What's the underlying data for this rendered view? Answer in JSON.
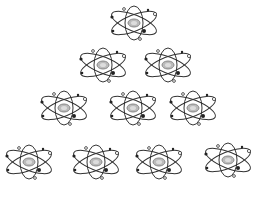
{
  "figure": {
    "rows": [
      {
        "count": 1,
        "atoms": [
          {
            "x": 107,
            "y": 4
          }
        ]
      },
      {
        "count": 2,
        "atoms": [
          {
            "x": 76,
            "y": 46
          },
          {
            "x": 141,
            "y": 46
          }
        ]
      },
      {
        "count": 3,
        "atoms": [
          {
            "x": 37,
            "y": 89
          },
          {
            "x": 106,
            "y": 89
          },
          {
            "x": 166,
            "y": 89
          }
        ]
      },
      {
        "count": 4,
        "atoms": [
          {
            "x": 2,
            "y": 143
          },
          {
            "x": 69,
            "y": 143
          },
          {
            "x": 132,
            "y": 143
          },
          {
            "x": 201,
            "y": 141
          }
        ]
      }
    ],
    "icon": "atom-icon",
    "colors": {
      "stroke": "#333333",
      "nucleus": "#9a9a9a",
      "background": "#ffffff"
    }
  }
}
